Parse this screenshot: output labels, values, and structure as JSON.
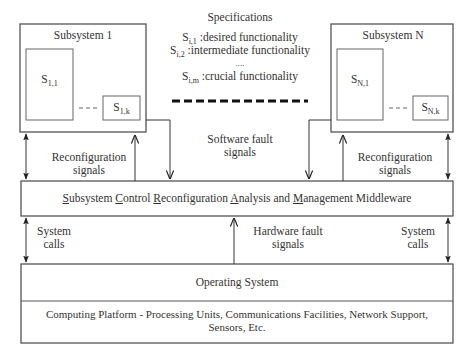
{
  "specifications": {
    "title": "Specifications",
    "items": [
      {
        "symbol": "S",
        "sub": "i,1",
        "text": ":desired functionality"
      },
      {
        "symbol": "S",
        "sub": "i,2",
        "text": ":intermediate functionality"
      },
      {
        "symbol": "",
        "sub": "",
        "text": "...."
      },
      {
        "symbol": "S",
        "sub": "i,m",
        "text": ":crucial functionality"
      }
    ]
  },
  "subsystems": [
    {
      "title": "Subsystem 1",
      "first": {
        "symbol": "S",
        "sub": "1,1"
      },
      "last": {
        "symbol": "S",
        "sub": "1,k"
      }
    },
    {
      "title": "Subsystem N",
      "first": {
        "symbol": "S",
        "sub": "N,1"
      },
      "last": {
        "symbol": "S",
        "sub": "N,k"
      }
    }
  ],
  "labels": {
    "reconfig_left": [
      "Reconfiguration",
      "signals"
    ],
    "reconfig_right": [
      "Reconfiguration",
      "signals"
    ],
    "software_fault": [
      "Software fault",
      "signals"
    ],
    "hardware_fault": [
      "Hardware fault",
      "signals"
    ],
    "syscalls_left": [
      "System",
      "calls"
    ],
    "syscalls_right": [
      "System",
      "calls"
    ]
  },
  "middleware": {
    "words": [
      {
        "first": "S",
        "rest": "ubsystem "
      },
      {
        "first": "C",
        "rest": "ontrol "
      },
      {
        "first": "R",
        "rest": "econfiguration "
      },
      {
        "first": "A",
        "rest": "nalysis and "
      },
      {
        "first": "M",
        "rest": "anagement Middleware"
      }
    ]
  },
  "os": {
    "title": "Operating System",
    "platform_line1": "Computing Platform - Processing Units, Communications Facilities, Network Support,",
    "platform_line2": "Sensors, Etc."
  }
}
